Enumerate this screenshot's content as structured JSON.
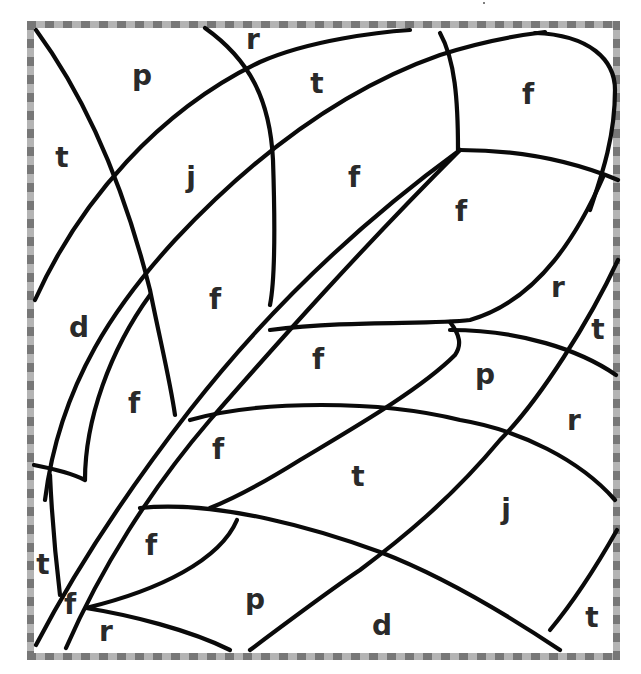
{
  "worksheet": {
    "type": "color-by-letter",
    "border_colors": {
      "dark": "#777777",
      "light": "#b4b4b4"
    },
    "line_color": "#0a0a0a",
    "letters": [
      {
        "id": "r-top",
        "char": "r",
        "x": 253,
        "y": 40
      },
      {
        "id": "p-top",
        "char": "p",
        "x": 142,
        "y": 76
      },
      {
        "id": "t-top",
        "char": "t",
        "x": 317,
        "y": 84
      },
      {
        "id": "f-topright",
        "char": "f",
        "x": 528,
        "y": 95
      },
      {
        "id": "t-left",
        "char": "t",
        "x": 62,
        "y": 158
      },
      {
        "id": "j-upper",
        "char": "j",
        "x": 191,
        "y": 178
      },
      {
        "id": "f-center-top",
        "char": "f",
        "x": 354,
        "y": 178
      },
      {
        "id": "f-right-upper",
        "char": "f",
        "x": 461,
        "y": 212
      },
      {
        "id": "r-right-upper",
        "char": "r",
        "x": 558,
        "y": 288
      },
      {
        "id": "f-mid",
        "char": "f",
        "x": 215,
        "y": 300
      },
      {
        "id": "d-left",
        "char": "d",
        "x": 79,
        "y": 328
      },
      {
        "id": "t-right-edge",
        "char": "t",
        "x": 598,
        "y": 330
      },
      {
        "id": "f-center",
        "char": "f",
        "x": 318,
        "y": 360
      },
      {
        "id": "p-right",
        "char": "p",
        "x": 485,
        "y": 375
      },
      {
        "id": "f-left-mid",
        "char": "f",
        "x": 134,
        "y": 404
      },
      {
        "id": "r-right",
        "char": "r",
        "x": 574,
        "y": 421
      },
      {
        "id": "f-lower-center",
        "char": "f",
        "x": 218,
        "y": 450
      },
      {
        "id": "t-center",
        "char": "t",
        "x": 358,
        "y": 477
      },
      {
        "id": "j-lower",
        "char": "j",
        "x": 506,
        "y": 510
      },
      {
        "id": "f-lower-left",
        "char": "f",
        "x": 151,
        "y": 546
      },
      {
        "id": "t-bottom-left",
        "char": "t",
        "x": 43,
        "y": 565
      },
      {
        "id": "p-bottom",
        "char": "p",
        "x": 255,
        "y": 600
      },
      {
        "id": "f-bottom-left",
        "char": "f",
        "x": 70,
        "y": 605
      },
      {
        "id": "d-bottom",
        "char": "d",
        "x": 382,
        "y": 626
      },
      {
        "id": "r-bottom",
        "char": "r",
        "x": 106,
        "y": 632
      },
      {
        "id": "t-bottom-right",
        "char": "t",
        "x": 592,
        "y": 618
      }
    ]
  }
}
